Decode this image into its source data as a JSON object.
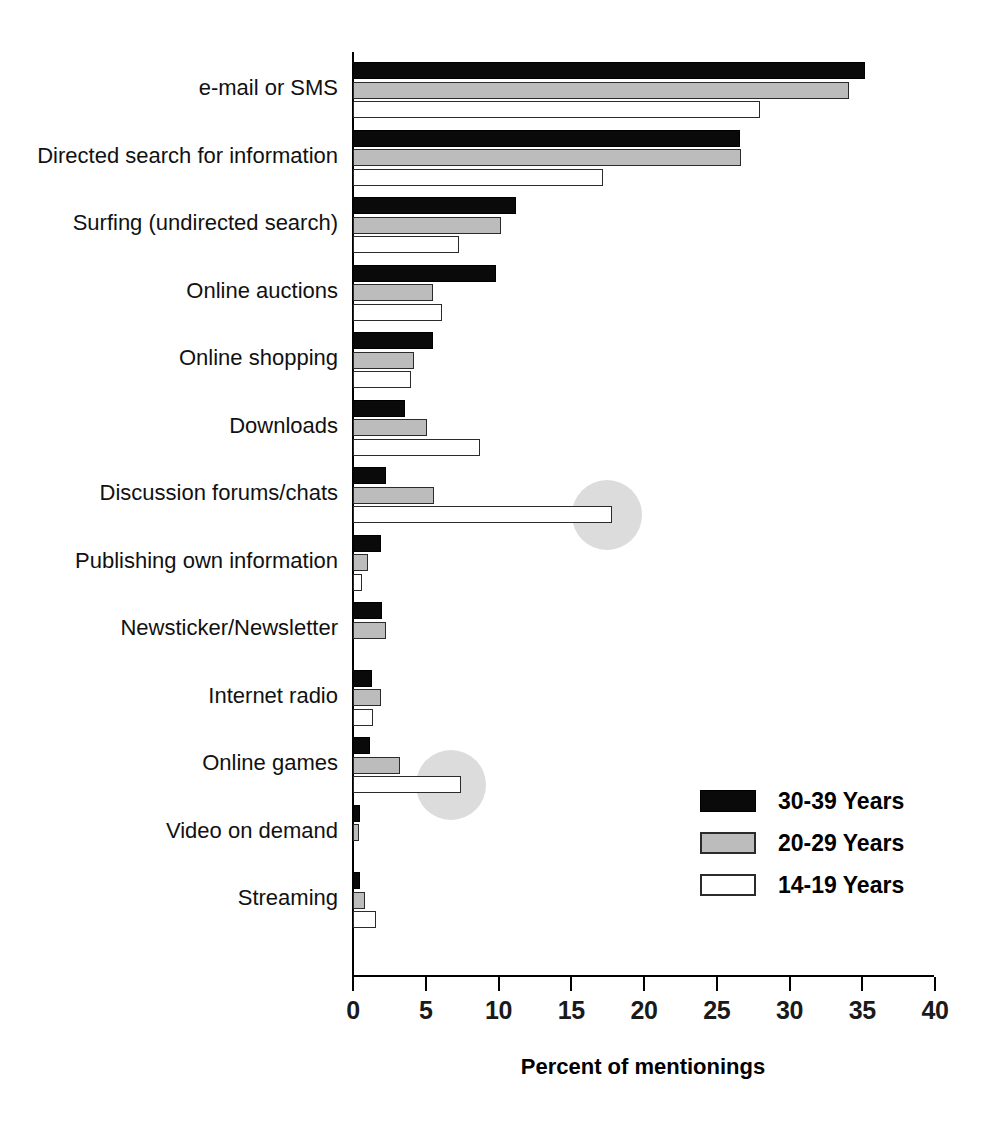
{
  "chart_data": {
    "type": "bar",
    "orientation": "horizontal",
    "title": "",
    "xlabel": "Percent of mentionings",
    "ylabel": "",
    "xlim": [
      0,
      40
    ],
    "xticks": [
      0,
      5,
      10,
      15,
      20,
      25,
      30,
      35,
      40
    ],
    "grid": false,
    "legend_position": "bottom-right",
    "categories": [
      "e-mail or SMS",
      "Directed search for information",
      "Surfing (undirected search)",
      "Online auctions",
      "Online shopping",
      "Downloads",
      "Discussion forums/chats",
      "Publishing own information",
      "Newsticker/Newsletter",
      "Internet radio",
      "Online games",
      "Video on demand",
      "Streaming"
    ],
    "series": [
      {
        "name": "30-39 Years",
        "color": "#0a0a0a",
        "values": [
          35.2,
          26.6,
          11.2,
          9.8,
          5.5,
          3.6,
          2.3,
          1.9,
          2.0,
          1.3,
          1.2,
          0.5,
          0.5
        ]
      },
      {
        "name": "20-29 Years",
        "color": "#bcbcbc",
        "values": [
          34.1,
          26.7,
          10.2,
          5.5,
          4.2,
          5.1,
          5.6,
          1.0,
          2.3,
          1.9,
          3.2,
          0.4,
          0.8
        ]
      },
      {
        "name": "14-19 Years",
        "color": "#ffffff",
        "values": [
          28.0,
          17.2,
          7.3,
          6.1,
          4.0,
          8.7,
          17.8,
          0.6,
          0.0,
          1.4,
          7.4,
          0.0,
          1.6
        ]
      }
    ],
    "annotations": [
      {
        "name": "highlight-discussion-forums",
        "shape": "circle",
        "category": "Discussion forums/chats",
        "series": "14-19 Years",
        "center_value": 17.5,
        "color": "#dcdcdc"
      },
      {
        "name": "highlight-online-games",
        "shape": "circle",
        "category": "Online games",
        "series": "14-19 Years",
        "center_value": 6.8,
        "color": "#dcdcdc"
      }
    ]
  },
  "legend": {
    "items": [
      {
        "label": "30-39 Years",
        "swatch": "black-filled-swatch"
      },
      {
        "label": "20-29 Years",
        "swatch": "gray-filled-swatch"
      },
      {
        "label": "14-19 Years",
        "swatch": "white-outlined-swatch"
      }
    ]
  },
  "axis": {
    "x_title": "Percent of mentionings",
    "tick_labels": [
      "0",
      "5",
      "10",
      "15",
      "20",
      "25",
      "30",
      "35",
      "40"
    ]
  }
}
